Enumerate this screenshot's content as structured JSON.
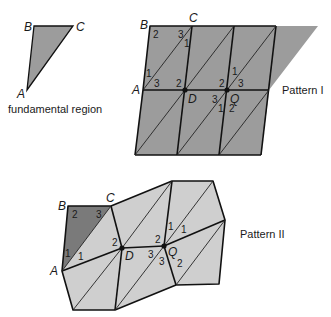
{
  "colors": {
    "pattern1_fill": "#9c9c9c",
    "fundamental_fill": "#9c9c9c",
    "pattern2_light_fill": "#cfcfcf",
    "pattern2_dark_fill": "#7a7a7a",
    "stroke": "#111111"
  },
  "fundamental_region": {
    "caption": "fundamental region",
    "vertices": {
      "A": "A",
      "B": "B",
      "C": "C"
    }
  },
  "pattern1": {
    "caption": "Pattern I",
    "vertex_labels": {
      "A": "A",
      "B": "B",
      "C": "C",
      "D": "D",
      "Q": "Q"
    },
    "angle_labels": {
      "b2": "2",
      "c3": "3",
      "c1": "1",
      "a1": "1",
      "a3": "3",
      "d2": "2",
      "q2": "2",
      "q1": "1",
      "q3": "3",
      "qb3": "3",
      "qb1": "1",
      "qb2": "2"
    }
  },
  "pattern2": {
    "caption": "Pattern II",
    "vertex_labels": {
      "A": "A",
      "B": "B",
      "C": "C",
      "D": "D",
      "Q": "Q"
    },
    "angle_labels": {
      "b2": "2",
      "c3": "3",
      "a1": "1",
      "a1b": "1",
      "d2": "2",
      "q2": "2",
      "q1": "1",
      "q1b": "1",
      "d3": "3",
      "q3": "3",
      "q2b": "2"
    }
  }
}
